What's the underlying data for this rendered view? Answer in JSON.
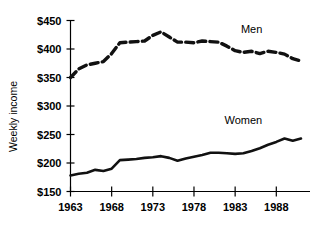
{
  "chart_data": {
    "type": "line",
    "title": "",
    "xlabel": "",
    "ylabel": "Weekly income",
    "xlim": [
      1963,
      1991
    ],
    "ylim": [
      150,
      450
    ],
    "grid": false,
    "legend_position": "inline-annotations",
    "y_ticks": [
      150,
      200,
      250,
      300,
      350,
      400,
      450
    ],
    "y_tick_labels": [
      "$150",
      "$200",
      "$250",
      "$300",
      "$350",
      "$400",
      "$450"
    ],
    "x_ticks": [
      1963,
      1968,
      1973,
      1978,
      1983,
      1988
    ],
    "x_tick_labels": [
      "1963",
      "1968",
      "1973",
      "1978",
      "1983",
      "1988"
    ],
    "x": [
      1963,
      1964,
      1965,
      1966,
      1967,
      1968,
      1969,
      1970,
      1971,
      1972,
      1973,
      1974,
      1975,
      1976,
      1977,
      1978,
      1979,
      1980,
      1981,
      1982,
      1983,
      1984,
      1985,
      1986,
      1987,
      1988,
      1989,
      1990,
      1991
    ],
    "series": [
      {
        "name": "Men",
        "style": "dashed",
        "values": [
          350,
          365,
          372,
          375,
          378,
          392,
          411,
          412,
          413,
          414,
          424,
          430,
          421,
          412,
          412,
          411,
          414,
          413,
          412,
          405,
          397,
          394,
          396,
          392,
          396,
          394,
          391,
          383,
          379
        ]
      },
      {
        "name": "Women",
        "style": "solid",
        "values": [
          178,
          181,
          183,
          188,
          186,
          190,
          205,
          206,
          207,
          209,
          210,
          212,
          209,
          204,
          208,
          211,
          214,
          218,
          218,
          217,
          216,
          217,
          221,
          226,
          232,
          237,
          243,
          239,
          243
        ]
      }
    ],
    "annotations": [
      {
        "text": "Men",
        "x": 1985,
        "y": 428
      },
      {
        "text": "Women",
        "x": 1984,
        "y": 268
      }
    ]
  },
  "labels": {
    "y_axis_title": "Weekly income",
    "men": "Men",
    "women": "Women"
  }
}
